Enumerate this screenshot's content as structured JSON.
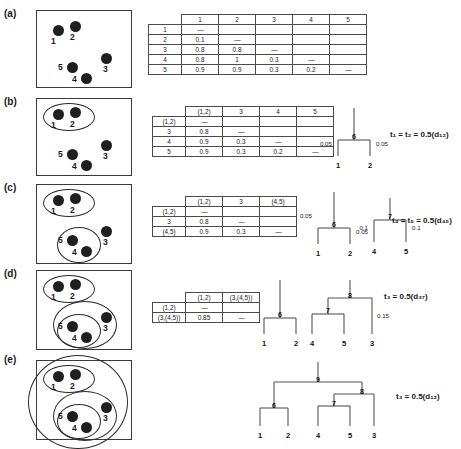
{
  "figure": {
    "panels": [
      "(a)",
      "(b)",
      "(c)",
      "(d)",
      "(e)"
    ]
  },
  "panel_a": {
    "label": "(a)",
    "points": [
      {
        "id": "1",
        "x": 16,
        "y": 14
      },
      {
        "id": "2",
        "x": 33,
        "y": 10
      },
      {
        "id": "3",
        "x": 64,
        "y": 42
      },
      {
        "id": "4",
        "x": 44,
        "y": 62
      },
      {
        "id": "5",
        "x": 30,
        "y": 51
      }
    ],
    "matrix": {
      "columns": [
        "1",
        "2",
        "3",
        "4",
        "5"
      ],
      "rows": [
        {
          "label": "1",
          "values": [
            "—",
            "",
            "",
            "",
            ""
          ]
        },
        {
          "label": "2",
          "values": [
            "0.1",
            "—",
            "",
            "",
            ""
          ]
        },
        {
          "label": "3",
          "values": [
            "0.8",
            "0.8",
            "—",
            "",
            ""
          ]
        },
        {
          "label": "4",
          "values": [
            "0.8",
            "1",
            "0.3",
            "—",
            ""
          ]
        },
        {
          "label": "5",
          "values": [
            "0.9",
            "0.9",
            "0.3",
            "0.2",
            "—"
          ]
        }
      ]
    }
  },
  "panel_b": {
    "label": "(b)",
    "clusters": [
      "(1,2)"
    ],
    "matrix": {
      "columns": [
        "(1,2)",
        "3",
        "4",
        "5"
      ],
      "rows": [
        {
          "label": "(1,2)",
          "values": [
            "—",
            "",
            "",
            ""
          ]
        },
        {
          "label": "3",
          "values": [
            "0.8",
            "—",
            "",
            ""
          ]
        },
        {
          "label": "4",
          "values": [
            "0.9",
            "0.3",
            "—",
            ""
          ]
        },
        {
          "label": "5",
          "values": [
            "0.9",
            "0.3",
            "0.2",
            "—"
          ]
        }
      ]
    },
    "tree": {
      "internal_nodes": [
        "6"
      ],
      "leaves": [
        "1",
        "2"
      ],
      "edge_labels": [
        "0.05",
        "0.05"
      ]
    },
    "formula": "t₁ = t₂ = 0.5(d₁₂)"
  },
  "panel_c": {
    "label": "(c)",
    "clusters": [
      "(1,2)",
      "(4,5)"
    ],
    "matrix": {
      "columns": [
        "(1,2)",
        "3",
        "(4,5)"
      ],
      "rows": [
        {
          "label": "(1,2)",
          "values": [
            "—",
            "",
            ""
          ]
        },
        {
          "label": "3",
          "values": [
            "0.8",
            "—",
            ""
          ]
        },
        {
          "label": "(4,5)",
          "values": [
            "0.9",
            "0.3",
            "—"
          ]
        }
      ]
    },
    "tree_left": {
      "internal_nodes": [
        "6"
      ],
      "leaves": [
        "1",
        "2"
      ],
      "edge_labels": [
        "0.05",
        "0.05"
      ]
    },
    "tree_right": {
      "internal_nodes": [
        "7"
      ],
      "leaves": [
        "4",
        "5"
      ],
      "edge_labels": [
        "0.1",
        "0.1"
      ]
    },
    "formula": "t₄ = t₅ = 0.5(d₄₅)"
  },
  "panel_d": {
    "label": "(d)",
    "clusters": [
      "(1,2)",
      "(3,(4,5))"
    ],
    "matrix": {
      "columns": [
        "(1,2)",
        "(3,(4,5))"
      ],
      "rows": [
        {
          "label": "(1,2)",
          "values": [
            "—",
            ""
          ]
        },
        {
          "label": "(3,(4,5))",
          "values": [
            "0.85",
            "—"
          ]
        }
      ]
    },
    "tree_left": {
      "internal_nodes": [
        "6"
      ],
      "leaves": [
        "1",
        "2"
      ]
    },
    "tree_right": {
      "internal_nodes": [
        "8",
        "7"
      ],
      "leaves": [
        "4",
        "5",
        "3"
      ],
      "edge_labels": [
        "0.15"
      ]
    },
    "formula": "t₃ = 0.5(d₃₇)"
  },
  "panel_e": {
    "label": "(e)",
    "clusters": [
      "(1,2)",
      "(4,5)",
      "(3,(4,5))",
      "all"
    ],
    "tree": {
      "internal_nodes": [
        "9",
        "8",
        "7",
        "6"
      ],
      "leaves": [
        "1",
        "2",
        "4",
        "5",
        "3"
      ]
    },
    "formula": "t₃ = 0.5(d₁₂)"
  }
}
